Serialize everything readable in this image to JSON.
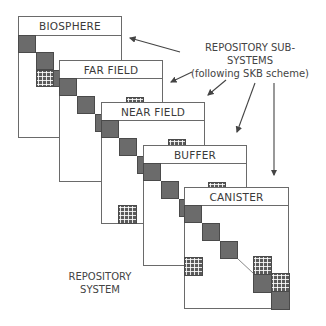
{
  "annotation": {
    "title": "REPOSITORY SUB-SYSTEMS",
    "subtitle": "(following SKB scheme)"
  },
  "system_label": {
    "line1": "REPOSITORY",
    "line2": "SYSTEM"
  },
  "panels": [
    {
      "name": "BIOSPHERE"
    },
    {
      "name": "FAR FIELD"
    },
    {
      "name": "NEAR FIELD"
    },
    {
      "name": "BUFFER"
    },
    {
      "name": "CANISTER"
    }
  ],
  "colors": {
    "outline": "#6a6a6a",
    "dark_cell": "#6b6b6b",
    "grid_cell": "#5a5a5a",
    "text": "#3a3a3a"
  }
}
